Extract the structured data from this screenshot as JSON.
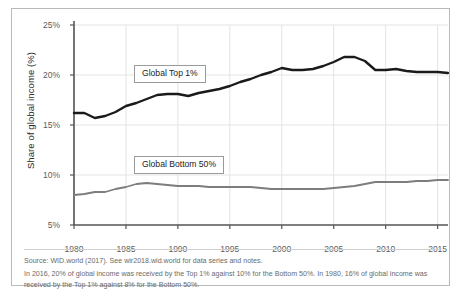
{
  "figure": {
    "ylabel": "Share of global income (%)"
  },
  "notes": {
    "source": "Source: WID.world (2017). See wir2018.wid.world for data series and notes.",
    "description": "In 2016, 20% of global income was received by the Top 1% against 10% for the Bottom 50%. In 1980, 16% of global income was received by the Top 1% against 8% for the Bottom 50%."
  },
  "callouts": {
    "top": "Global Top 1%",
    "bottom": "Global Bottom 50%"
  },
  "colors": {
    "top_series": "#1a1a1a",
    "bottom_series": "#7d7d7d",
    "grid": "#e3e3e3",
    "axis": "#555555",
    "frame": "#b9b9b9",
    "tick_text": "#5d5d5d"
  },
  "chart_data": {
    "type": "line",
    "title": "",
    "xlabel": "",
    "ylabel": "Share of global income (%)",
    "xlim": [
      1980,
      2016
    ],
    "ylim": [
      5,
      25
    ],
    "ytick_labels": [
      "5%",
      "10%",
      "15%",
      "20%",
      "25%"
    ],
    "ytick_values": [
      5,
      10,
      15,
      20,
      25
    ],
    "xtick_labels": [
      "1980",
      "1985",
      "1990",
      "1995",
      "2000",
      "2005",
      "2010",
      "2015"
    ],
    "xtick_values": [
      1980,
      1985,
      1990,
      1995,
      2000,
      2005,
      2010,
      2015
    ],
    "grid": true,
    "legend": "inline-callout-boxes",
    "x": [
      1980,
      1981,
      1982,
      1983,
      1984,
      1985,
      1986,
      1987,
      1988,
      1989,
      1990,
      1991,
      1992,
      1993,
      1994,
      1995,
      1996,
      1997,
      1998,
      1999,
      2000,
      2001,
      2002,
      2003,
      2004,
      2005,
      2006,
      2007,
      2008,
      2009,
      2010,
      2011,
      2012,
      2013,
      2014,
      2015,
      2016
    ],
    "series": [
      {
        "name": "Global Top 1%",
        "color": "#1a1a1a",
        "values": [
          16.2,
          16.2,
          15.7,
          15.9,
          16.3,
          16.9,
          17.2,
          17.6,
          18.0,
          18.1,
          18.1,
          17.9,
          18.2,
          18.4,
          18.6,
          18.9,
          19.3,
          19.6,
          20.0,
          20.3,
          20.7,
          20.5,
          20.5,
          20.6,
          20.9,
          21.3,
          21.8,
          21.8,
          21.4,
          20.5,
          20.5,
          20.6,
          20.4,
          20.3,
          20.3,
          20.3,
          20.2
        ]
      },
      {
        "name": "Global Bottom 50%",
        "color": "#7d7d7d",
        "values": [
          8.0,
          8.1,
          8.3,
          8.3,
          8.6,
          8.8,
          9.1,
          9.2,
          9.1,
          9.0,
          8.9,
          8.9,
          8.9,
          8.8,
          8.8,
          8.8,
          8.8,
          8.8,
          8.7,
          8.6,
          8.6,
          8.6,
          8.6,
          8.6,
          8.6,
          8.7,
          8.8,
          8.9,
          9.1,
          9.3,
          9.3,
          9.3,
          9.3,
          9.4,
          9.4,
          9.5,
          9.5
        ]
      }
    ]
  }
}
